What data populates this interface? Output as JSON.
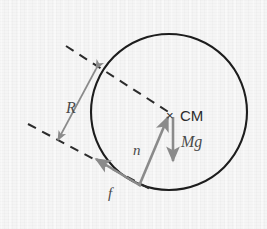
{
  "figure": {
    "background_color": "#f5f5f5",
    "width": 267,
    "height": 229
  },
  "colors": {
    "circle_stroke": "#1d1d1d",
    "dashed_line": "#2b2b2b",
    "force_vector": "#8a8a8a",
    "dimension_arrow": "#8a8a8a",
    "label_dark": "#2b2b2b",
    "label_gray": "#4a4a4a"
  },
  "body": {
    "shape": "circle",
    "center": {
      "x": 169,
      "y": 112
    },
    "radius": 78,
    "stroke_width": 2.1
  },
  "center_of_mass": {
    "marker_glyph": "×",
    "marker": {
      "x": 172,
      "y": 115
    },
    "label": "CM",
    "label_position": {
      "x": 181,
      "y": 121
    }
  },
  "vectors": [
    {
      "name": "normal-force",
      "label": "n",
      "label_position": {
        "x": 133,
        "y": 155
      },
      "from": {
        "x": 139,
        "y": 186
      },
      "to": {
        "x": 168,
        "y": 117
      },
      "color": "#8a8a8a"
    },
    {
      "name": "weight-force",
      "label": "Mg",
      "label_position": {
        "x": 182,
        "y": 146
      },
      "from": {
        "x": 173,
        "y": 117
      },
      "to": {
        "x": 173,
        "y": 161
      },
      "color": "#8a8a8a"
    },
    {
      "name": "friction-force",
      "label": "f",
      "label_position": {
        "x": 108,
        "y": 198
      },
      "from": {
        "x": 141,
        "y": 186
      },
      "to": {
        "x": 96,
        "y": 159
      },
      "color": "#8a8a8a"
    }
  ],
  "dimension": {
    "name": "radius-dimension",
    "label": "R",
    "label_position": {
      "x": 68,
      "y": 112
    },
    "arrow_head_1": {
      "x": 96,
      "y": 69
    },
    "arrow_head_2": {
      "x": 58,
      "y": 140
    },
    "double_headed": true,
    "color": "#8a8a8a"
  },
  "dashed_lines": [
    {
      "name": "radius-construction-line",
      "from": {
        "x": 66,
        "y": 46
      },
      "to": {
        "x": 170,
        "y": 113
      },
      "dash_pattern": "9 7"
    },
    {
      "name": "incline-surface-line",
      "from": {
        "x": 28,
        "y": 124
      },
      "to": {
        "x": 152,
        "y": 190
      },
      "dash_pattern": "9 7"
    }
  ]
}
